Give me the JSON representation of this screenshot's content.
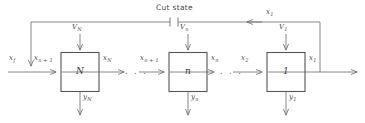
{
  "diagram": {
    "title": "Cut state",
    "type": "block-diagram-cascade-feedback",
    "stroke_color": "#6b6b6b",
    "box_border_color": "#555555",
    "text_color": "#4a4a4a",
    "background": "#ffffff",
    "cut_marker": "break-symbol",
    "blocks": [
      {
        "id": "block-N",
        "label": "N",
        "input_left": "x",
        "input_left_sub": "n + 1",
        "input_top": "V",
        "input_top_sub": "N",
        "output_right": "x",
        "output_right_sub": "N",
        "output_bottom": "y",
        "output_bottom_sub": "N"
      },
      {
        "id": "block-n",
        "label": "n",
        "input_left": "x",
        "input_left_sub": "n + 1",
        "input_top": "V",
        "input_top_sub": "n",
        "output_right": "x",
        "output_right_sub": "n",
        "output_bottom": "y",
        "output_bottom_sub": "n"
      },
      {
        "id": "block-1",
        "label": "1",
        "input_left": "x",
        "input_left_sub": "2",
        "input_top": "V",
        "input_top_sub": "1",
        "output_right": "x",
        "output_right_sub": "1",
        "output_bottom": "y",
        "output_bottom_sub": "1"
      }
    ],
    "feedback": {
      "label": "x",
      "label_sub": "1"
    },
    "source_input": {
      "label": "x",
      "label_sub": "f"
    },
    "ellipsis": ". . ."
  }
}
